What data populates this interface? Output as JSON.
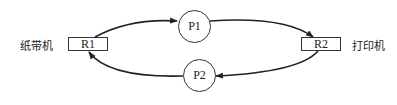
{
  "diagram": {
    "left_device_label": "纸带机",
    "right_device_label": "打印机",
    "resources": [
      {
        "id": "R1",
        "label": "R1"
      },
      {
        "id": "R2",
        "label": "R2"
      }
    ],
    "processes": [
      {
        "id": "P1",
        "label": "P1"
      },
      {
        "id": "P2",
        "label": "P2"
      }
    ],
    "edges": [
      {
        "from": "R1",
        "to": "P1"
      },
      {
        "from": "P1",
        "to": "R2"
      },
      {
        "from": "R2",
        "to": "P2"
      },
      {
        "from": "P2",
        "to": "R1"
      }
    ],
    "stroke_color": "#222222"
  }
}
